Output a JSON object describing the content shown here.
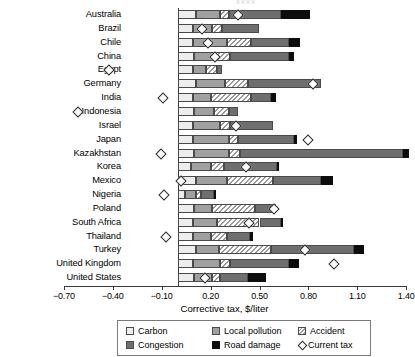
{
  "title_fragment": "xxxx",
  "axis": {
    "x_title": "Corrective tax, $/liter",
    "x_ticks": [
      "−0.70",
      "−0.40",
      "−0.10",
      "0.20",
      "0.50",
      "0.80",
      "1.10",
      "1.40"
    ],
    "x_tick_values": [
      -0.7,
      -0.4,
      -0.1,
      0.2,
      0.5,
      0.8,
      1.1,
      1.4
    ]
  },
  "legend": {
    "items": [
      {
        "label": "Carbon",
        "key": "carbon",
        "swatch": "carbon-swatch"
      },
      {
        "label": "Local pollution",
        "key": "local_pollution",
        "swatch": "local-pollution-swatch"
      },
      {
        "label": "Accident",
        "key": "accident",
        "swatch": "accident-swatch"
      },
      {
        "label": "Congestion",
        "key": "congestion",
        "swatch": "congestion-swatch"
      },
      {
        "label": "Road damage",
        "key": "road_damage",
        "swatch": "road-damage-swatch"
      },
      {
        "label": "Current tax",
        "key": "current_tax",
        "swatch": "current-tax-diamond"
      }
    ]
  },
  "colors": {
    "carbon": "#ededed",
    "local_pollution": "#a0a0a0",
    "accident": "#9a9a9a",
    "congestion": "#6f6f6f",
    "road_damage": "#0d0d0d",
    "current_tax_marker": "#2b2b2b",
    "axis": "#3a3a3a"
  },
  "chart_data": {
    "type": "bar",
    "orientation": "horizontal",
    "stacked": true,
    "title": "",
    "xlabel": "Corrective tax, $/liter",
    "ylabel": "",
    "xlim": [
      -0.7,
      1.4
    ],
    "grid": false,
    "legend_position": "bottom",
    "categories": [
      "Australia",
      "Brazil",
      "Chile",
      "China",
      "Egypt",
      "Germany",
      "India",
      "Indonesia",
      "Israel",
      "Japan",
      "Kazakhstan",
      "Korea",
      "Mexico",
      "Nigeria",
      "Poland",
      "South Africa",
      "Thailand",
      "Turkey",
      "United Kingdom",
      "United States"
    ],
    "series": [
      {
        "name": "Carbon",
        "values": [
          0.11,
          0.09,
          0.09,
          0.1,
          0.09,
          0.11,
          0.09,
          0.1,
          0.09,
          0.09,
          0.1,
          0.08,
          0.11,
          0.04,
          0.1,
          0.09,
          0.09,
          0.11,
          0.09,
          0.1
        ]
      },
      {
        "name": "Local pollution",
        "values": [
          0.15,
          0.12,
          0.21,
          0.13,
          0.08,
          0.18,
          0.11,
          0.12,
          0.17,
          0.22,
          0.21,
          0.12,
          0.19,
          0.07,
          0.11,
          0.15,
          0.11,
          0.14,
          0.17,
          0.11
        ]
      },
      {
        "name": "Accident",
        "values": [
          0.05,
          0.06,
          0.15,
          0.09,
          0.07,
          0.14,
          0.25,
          0.09,
          0.06,
          0.06,
          0.07,
          0.08,
          0.28,
          0.03,
          0.26,
          0.26,
          0.1,
          0.32,
          0.06,
          0.05
        ]
      },
      {
        "name": "Congestion",
        "values": [
          0.32,
          0.23,
          0.23,
          0.36,
          0.03,
          0.45,
          0.12,
          0.06,
          0.26,
          0.34,
          1.0,
          0.33,
          0.3,
          0.08,
          0.13,
          0.13,
          0.14,
          0.51,
          0.36,
          0.17
        ]
      },
      {
        "name": "Road damage",
        "values": [
          0.18,
          0.0,
          0.07,
          0.03,
          0.0,
          0.0,
          0.03,
          0.0,
          0.0,
          0.02,
          0.04,
          0.01,
          0.07,
          0.01,
          0.0,
          0.01,
          0.02,
          0.06,
          0.06,
          0.11
        ]
      }
    ],
    "current_tax": [
      0.36,
      0.14,
      0.18,
      0.22,
      -0.43,
      0.82,
      -0.1,
      -0.62,
      0.35,
      0.79,
      -0.11,
      0.41,
      0.01,
      -0.09,
      0.58,
      0.43,
      -0.08,
      0.77,
      0.95,
      0.16
    ],
    "current_tax_label": "Current tax"
  }
}
